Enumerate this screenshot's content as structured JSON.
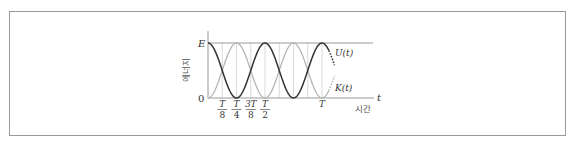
{
  "diagram": {
    "title": "",
    "y_axis_label": "에너지",
    "x_axis_label": "시간",
    "x_axis_symbol": "t",
    "y_ticks": [
      {
        "label": "E",
        "value": 1
      },
      {
        "label": "0",
        "value": 0
      }
    ],
    "x_ticks": [
      {
        "num": "T",
        "den": "8",
        "frac": 0.125
      },
      {
        "num": "T",
        "den": "4",
        "frac": 0.25
      },
      {
        "num": "3T",
        "den": "8",
        "frac": 0.375
      },
      {
        "num": "T",
        "den": "2",
        "frac": 0.5
      },
      {
        "num": "T",
        "den": "",
        "frac": 1.0
      }
    ],
    "curves": [
      {
        "name": "U(t)",
        "label": "U(t)",
        "formula": "E cos^2(2πt/T)",
        "color": "#333333"
      },
      {
        "name": "K(t)",
        "label": "K(t)",
        "formula": "E sin^2(2πt/T)",
        "color": "#b5b5b5"
      }
    ],
    "colors": {
      "axis": "#9a9a9a",
      "gridline": "#cfcfcf",
      "frame": "#9a9a9a",
      "text": "#333333"
    }
  }
}
